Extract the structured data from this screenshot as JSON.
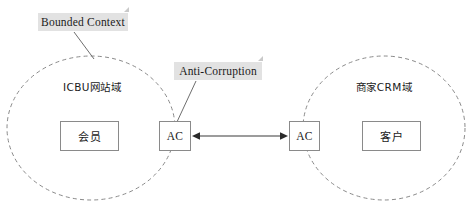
{
  "diagram": {
    "background_color": "#ffffff",
    "stroke_color": "#8a8a8a",
    "note_background_color": "#e2e2e2",
    "text_color": "#1a1a1a"
  },
  "contexts": [
    {
      "id": "icbu",
      "label": "ICBU网站域",
      "shape": "dashed-ellipse"
    },
    {
      "id": "crm",
      "label": "商家CRM域",
      "shape": "dashed-ellipse"
    }
  ],
  "entities": {
    "member": "会员",
    "customer": "客户",
    "ac_left": "AC",
    "ac_right": "AC"
  },
  "notes": [
    {
      "id": "bounded-context",
      "label": "Bounded Context",
      "points_to": "icbu-context-boundary"
    },
    {
      "id": "anti-corruption",
      "label": "Anti-Corruption",
      "points_to": "ac-box-left"
    }
  ],
  "connector": {
    "id": "ac-to-ac",
    "style": "double-headed-arrow",
    "from": "ac_right",
    "to": "ac_left"
  }
}
